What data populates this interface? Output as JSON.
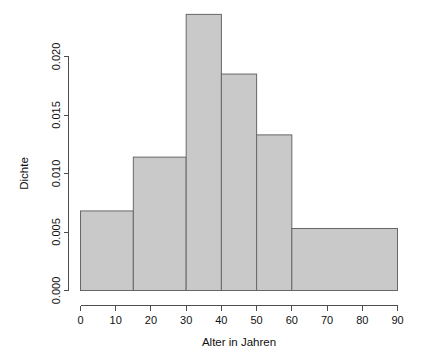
{
  "chart_data": {
    "type": "bar",
    "title": "",
    "subtitle": "",
    "xlabel": "Alter in Jahren",
    "ylabel": "Dichte",
    "grid": false,
    "legend": false,
    "legend_position": "none",
    "xlim": [
      0,
      90
    ],
    "ylim": [
      0,
      0.0236
    ],
    "xticks": [
      0,
      10,
      20,
      30,
      40,
      50,
      60,
      70,
      80,
      90
    ],
    "xtick_labels": [
      "0",
      "10",
      "20",
      "30",
      "40",
      "50",
      "60",
      "70",
      "80",
      "90"
    ],
    "yticks": [
      0,
      0.005,
      0.01,
      0.015,
      0.02
    ],
    "ytick_labels": [
      "0.000",
      "0.005",
      "0.010",
      "0.015",
      "0.020"
    ],
    "bin_edges": [
      0,
      15,
      30,
      40,
      50,
      60,
      90
    ],
    "categories": [
      "0-15",
      "15-30",
      "30-40",
      "40-50",
      "50-60",
      "60-90"
    ],
    "values": [
      0.0068,
      0.0114,
      0.0236,
      0.0185,
      0.0133,
      0.0053
    ],
    "bars": [
      {
        "label": "0-15",
        "x0": 0,
        "x1": 15,
        "density": 0.0068
      },
      {
        "label": "15-30",
        "x0": 15,
        "x1": 30,
        "density": 0.0114
      },
      {
        "label": "30-40",
        "x0": 30,
        "x1": 40,
        "density": 0.0236
      },
      {
        "label": "40-50",
        "x0": 40,
        "x1": 50,
        "density": 0.0185
      },
      {
        "label": "50-60",
        "x0": 50,
        "x1": 60,
        "density": 0.0133
      },
      {
        "label": "60-90",
        "x0": 60,
        "x1": 90,
        "density": 0.0053
      }
    ],
    "colors": {
      "bar_fill": "#c9c9c9",
      "bar_stroke": "#676767",
      "axis": "#4d4d4d",
      "text": "#111111",
      "background": "#ffffff"
    }
  }
}
